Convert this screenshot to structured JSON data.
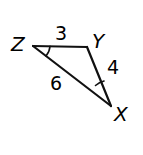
{
  "figure": {
    "type": "triangle-diagram",
    "background_color": "#ffffff",
    "stroke_color": "#111111",
    "stroke_width": 2.2,
    "vertices": [
      {
        "name": "Z",
        "label": "Z",
        "x": 33,
        "y": 46
      },
      {
        "name": "Y",
        "label": "Y",
        "x": 87,
        "y": 47
      },
      {
        "name": "X",
        "label": "X",
        "x": 111,
        "y": 106
      }
    ],
    "sides": [
      {
        "name": "ZY",
        "label": "3",
        "from": "Z",
        "to": "Y"
      },
      {
        "name": "YX",
        "label": "4",
        "from": "Y",
        "to": "X"
      },
      {
        "name": "ZX",
        "label": "6",
        "from": "Z",
        "to": "X"
      }
    ],
    "angle_marks": [
      {
        "name": "angle-Z",
        "vertex": "Z",
        "ticks": 1
      },
      {
        "name": "angle-X",
        "vertex": "X",
        "ticks": 1
      }
    ]
  },
  "labels": {
    "vertex_z": "Z",
    "vertex_y": "Y",
    "vertex_x": "X",
    "side_zy": "3",
    "side_yx": "4",
    "side_zx": "6"
  }
}
